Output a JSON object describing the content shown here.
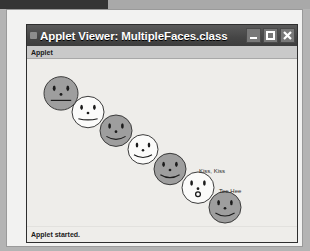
{
  "window": {
    "title": "Applet Viewer: MultipleFaces.class",
    "icon_name": "applet-window-icon",
    "buttons": {
      "minimize_label": "Minimize",
      "maximize_label": "Maximize",
      "close_label": "Close"
    }
  },
  "menubar": {
    "items": [
      {
        "label": "Applet"
      }
    ]
  },
  "statusbar": {
    "text": "Applet started."
  },
  "applet": {
    "background": "#eeedea",
    "outline_color": "#3a3a3a",
    "fill_gray": "#9e9e9e",
    "fill_white": "#fbfbfa",
    "faces": [
      {
        "index": 1,
        "cx": 34,
        "cy": 35,
        "r": 17,
        "fill": "gray",
        "mouth": "frown"
      },
      {
        "index": 2,
        "cx": 61,
        "cy": 54,
        "r": 16,
        "fill": "white",
        "mouth": "smile-flat"
      },
      {
        "index": 3,
        "cx": 89,
        "cy": 73,
        "r": 16,
        "fill": "gray",
        "mouth": "smile"
      },
      {
        "index": 4,
        "cx": 116,
        "cy": 92,
        "r": 15,
        "fill": "white",
        "mouth": "smile"
      },
      {
        "index": 5,
        "cx": 143,
        "cy": 112,
        "r": 16,
        "fill": "gray",
        "mouth": "smile"
      },
      {
        "index": 6,
        "cx": 171,
        "cy": 131,
        "r": 16,
        "fill": "white",
        "mouth": "kiss"
      },
      {
        "index": 7,
        "cx": 198,
        "cy": 151,
        "r": 16,
        "fill": "gray",
        "mouth": "smile"
      }
    ],
    "labels": [
      {
        "text": "Kiss, Kiss",
        "x": 172,
        "y": 111
      },
      {
        "text": "Tee Hee",
        "x": 192,
        "y": 131
      }
    ]
  }
}
